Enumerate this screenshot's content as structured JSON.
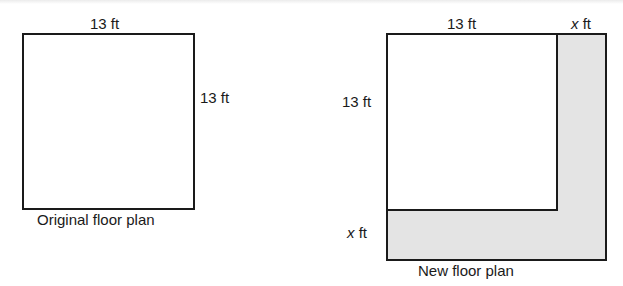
{
  "original": {
    "top_label": "13 ft",
    "side_label": "13 ft",
    "caption": "Original floor plan"
  },
  "new_plan": {
    "top_label": "13 ft",
    "top_extension_var": "x",
    "top_extension_unit": "ft",
    "side_label": "13 ft",
    "bottom_extension_var": "x",
    "bottom_extension_unit": "ft",
    "caption": "New floor plan",
    "shade_color": "#e4e4e4"
  }
}
